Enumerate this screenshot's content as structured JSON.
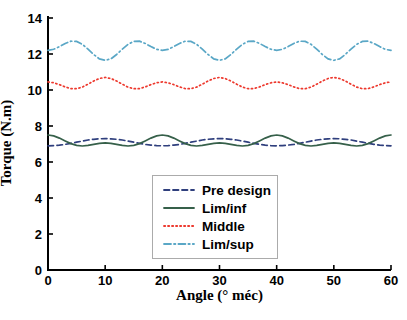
{
  "chart_data": {
    "type": "line",
    "title": "",
    "xlabel": "Angle (° méc)",
    "ylabel": "Torque (N.m)",
    "xlim": [
      0,
      60
    ],
    "ylim": [
      0,
      14
    ],
    "x_ticks": [
      0,
      10,
      20,
      30,
      40,
      50,
      60
    ],
    "y_ticks": [
      0,
      2,
      4,
      6,
      8,
      10,
      12,
      14
    ],
    "grid": false,
    "legend_position": "inside-bottom-center",
    "axis_color": "#000000",
    "legend_border_color": "#ababab",
    "x": [
      0,
      1,
      2,
      3,
      4,
      5,
      6,
      7,
      8,
      9,
      10,
      11,
      12,
      13,
      14,
      15,
      16,
      17,
      18,
      19,
      20,
      21,
      22,
      23,
      24,
      25,
      26,
      27,
      28,
      29,
      30,
      31,
      32,
      33,
      34,
      35,
      36,
      37,
      38,
      39,
      40,
      41,
      42,
      43,
      44,
      45,
      46,
      47,
      48,
      49,
      50,
      51,
      52,
      53,
      54,
      55,
      56,
      57,
      58,
      59,
      60
    ],
    "series": [
      {
        "name": "Pre design",
        "color": "#2f3f7d",
        "style": "dashed",
        "values": [
          6.9,
          6.91,
          6.94,
          6.98,
          7.04,
          7.1,
          7.16,
          7.22,
          7.26,
          7.29,
          7.3,
          7.29,
          7.26,
          7.22,
          7.16,
          7.1,
          7.04,
          6.98,
          6.94,
          6.91,
          6.9,
          6.91,
          6.94,
          6.98,
          7.04,
          7.1,
          7.16,
          7.22,
          7.26,
          7.29,
          7.3,
          7.29,
          7.26,
          7.22,
          7.16,
          7.1,
          7.04,
          6.98,
          6.94,
          6.91,
          6.9,
          6.91,
          6.94,
          6.98,
          7.04,
          7.1,
          7.16,
          7.22,
          7.26,
          7.29,
          7.3,
          7.29,
          7.26,
          7.22,
          7.16,
          7.1,
          7.04,
          6.98,
          6.94,
          6.91,
          6.9
        ]
      },
      {
        "name": "Lim/inf",
        "color": "#36604a",
        "style": "solid",
        "values": [
          7.5,
          7.45,
          7.33,
          7.17,
          7.02,
          6.92,
          6.89,
          6.92,
          6.98,
          7.04,
          7.06,
          7.04,
          6.98,
          6.92,
          6.89,
          6.92,
          7.02,
          7.17,
          7.33,
          7.45,
          7.5,
          7.45,
          7.33,
          7.17,
          7.02,
          6.92,
          6.89,
          6.92,
          6.98,
          7.04,
          7.06,
          7.04,
          6.98,
          6.92,
          6.89,
          6.92,
          7.02,
          7.17,
          7.33,
          7.45,
          7.5,
          7.45,
          7.33,
          7.17,
          7.02,
          6.92,
          6.89,
          6.92,
          6.98,
          7.04,
          7.06,
          7.04,
          6.98,
          6.92,
          6.89,
          6.92,
          7.02,
          7.17,
          7.33,
          7.45,
          7.5
        ]
      },
      {
        "name": "Middle",
        "color": "#ed392e",
        "style": "dotted",
        "values": [
          10.45,
          10.4,
          10.3,
          10.17,
          10.08,
          10.07,
          10.16,
          10.32,
          10.5,
          10.64,
          10.7,
          10.64,
          10.5,
          10.32,
          10.16,
          10.07,
          10.08,
          10.17,
          10.3,
          10.4,
          10.45,
          10.4,
          10.3,
          10.17,
          10.08,
          10.07,
          10.16,
          10.32,
          10.5,
          10.64,
          10.7,
          10.64,
          10.5,
          10.32,
          10.16,
          10.07,
          10.08,
          10.17,
          10.3,
          10.4,
          10.45,
          10.4,
          10.3,
          10.17,
          10.08,
          10.07,
          10.16,
          10.32,
          10.5,
          10.64,
          10.7,
          10.64,
          10.5,
          10.32,
          10.16,
          10.07,
          10.08,
          10.17,
          10.3,
          10.4,
          10.45
        ]
      },
      {
        "name": "Lim/sup",
        "color": "#5aa7c6",
        "style": "dashdot",
        "values": [
          12.2,
          12.26,
          12.41,
          12.59,
          12.71,
          12.7,
          12.54,
          12.27,
          11.97,
          11.73,
          11.65,
          11.73,
          11.97,
          12.27,
          12.54,
          12.7,
          12.71,
          12.59,
          12.41,
          12.26,
          12.2,
          12.26,
          12.41,
          12.59,
          12.71,
          12.7,
          12.54,
          12.27,
          11.97,
          11.73,
          11.65,
          11.73,
          11.97,
          12.27,
          12.54,
          12.7,
          12.71,
          12.59,
          12.41,
          12.26,
          12.2,
          12.26,
          12.41,
          12.59,
          12.71,
          12.7,
          12.54,
          12.27,
          11.97,
          11.73,
          11.65,
          11.73,
          11.97,
          12.27,
          12.54,
          12.7,
          12.71,
          12.59,
          12.41,
          12.26,
          12.2
        ]
      }
    ]
  }
}
